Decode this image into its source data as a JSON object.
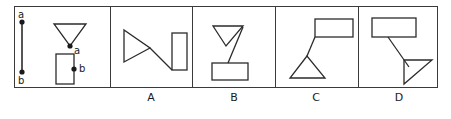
{
  "figure": {
    "type": "geometry-multiple-choice",
    "stroke_color": "#2b2b2b",
    "background_color": "#ffffff",
    "reference_panel": {
      "name": "reference",
      "segment": {
        "label_top": "a",
        "label_bottom": "b",
        "x": 22,
        "y_top": 22,
        "y_bottom": 72
      },
      "triangle": {
        "orientation": "pointing-down",
        "vertex_label": "a",
        "points": "54,24 86,24 70,46"
      },
      "rectangle": {
        "orientation": "vertical",
        "vertex_label": "b",
        "x": 56,
        "y": 54,
        "width": 18,
        "height": 30
      }
    },
    "options": [
      {
        "label": "A",
        "triangle": {
          "orientation": "pointing-right",
          "points": "124,30 124,62 150,48"
        },
        "rectangle": {
          "orientation": "vertical",
          "x": 172,
          "y": 33,
          "width": 15,
          "height": 37
        },
        "connector": {
          "x1": 150,
          "y1": 48,
          "x2": 172,
          "y2": 70
        }
      },
      {
        "label": "B",
        "triangle": {
          "orientation": "pointing-down",
          "points": "213,26 243,26 226,46"
        },
        "rectangle": {
          "orientation": "horizontal",
          "x": 212,
          "y": 63,
          "width": 36,
          "height": 17
        },
        "connector": {
          "x1": 243,
          "y1": 27,
          "x2": 228,
          "y2": 63
        }
      },
      {
        "label": "C",
        "triangle": {
          "orientation": "pointing-up",
          "points": "307,56 290,78 325,78"
        },
        "rectangle": {
          "orientation": "horizontal",
          "x": 315,
          "y": 19,
          "width": 38,
          "height": 18
        },
        "connector": {
          "x1": 307,
          "y1": 56,
          "x2": 315,
          "y2": 37
        }
      },
      {
        "label": "D",
        "triangle": {
          "orientation": "right-triangle-upper-right",
          "points": "404,60 432,60 404,84"
        },
        "rectangle": {
          "orientation": "horizontal",
          "x": 372,
          "y": 18,
          "width": 44,
          "height": 19
        },
        "connector": {
          "x1": 388,
          "y1": 37,
          "x2": 409,
          "y2": 67
        }
      }
    ]
  }
}
